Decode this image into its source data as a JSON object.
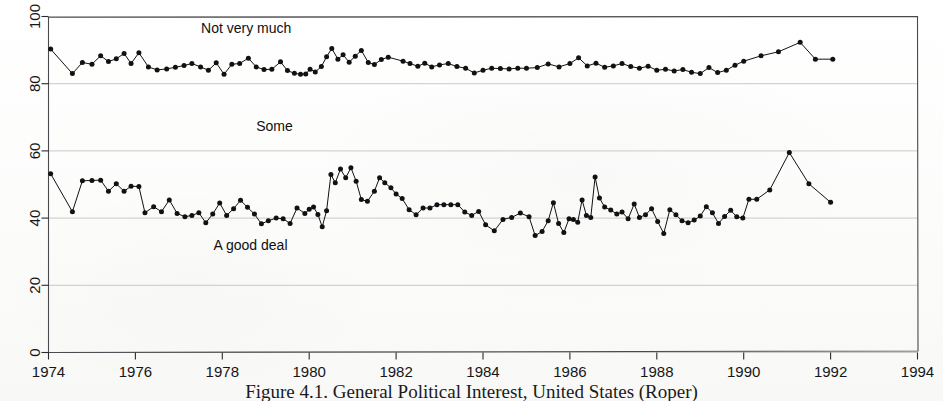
{
  "figure": {
    "caption": "Figure 4.1.  General Political Interest, United States (Roper)",
    "background_color": "#fdfdfc",
    "ink_color": "#111114",
    "gridline_color": "#c9c9c9"
  },
  "chart_data": {
    "type": "line",
    "title": "",
    "subtitle": "",
    "xlabel": "",
    "ylabel": "",
    "xlim": [
      1974,
      1994
    ],
    "ylim": [
      0,
      100
    ],
    "xticks": [
      1974,
      1976,
      1978,
      1980,
      1982,
      1984,
      1986,
      1988,
      1990,
      1992,
      1994
    ],
    "yticks": [
      0,
      20,
      40,
      60,
      80,
      100
    ],
    "xtick_labels": [
      "1974",
      "1976",
      "1978",
      "1980",
      "1982",
      "1984",
      "1986",
      "1988",
      "1990",
      "1992",
      "1994"
    ],
    "ytick_labels": [
      "0",
      "20",
      "40",
      "60",
      "80",
      "100"
    ],
    "grid": true,
    "grid_axis": "y",
    "legend": "none",
    "marker": "filled-circle",
    "annotations": [
      {
        "id": "not-very-much",
        "text": "Not very much",
        "x": 1978.55,
        "y": 95.0
      },
      {
        "id": "some",
        "text": "Some",
        "x": 1979.2,
        "y": 66.0
      },
      {
        "id": "a-good-deal",
        "text": "A good deal",
        "x": 1978.65,
        "y": 30.5
      }
    ],
    "series": [
      {
        "name": "Not very much",
        "color": "#111114",
        "points": [
          [
            1974.05,
            90.3
          ],
          [
            1974.55,
            83.0
          ],
          [
            1974.78,
            86.3
          ],
          [
            1975.0,
            85.8
          ],
          [
            1975.2,
            88.3
          ],
          [
            1975.38,
            86.6
          ],
          [
            1975.56,
            87.4
          ],
          [
            1975.74,
            89.0
          ],
          [
            1975.9,
            86.0
          ],
          [
            1976.08,
            89.2
          ],
          [
            1976.3,
            85.0
          ],
          [
            1976.5,
            84.1
          ],
          [
            1976.72,
            84.4
          ],
          [
            1976.92,
            84.9
          ],
          [
            1977.12,
            85.4
          ],
          [
            1977.3,
            86.0
          ],
          [
            1977.5,
            85.0
          ],
          [
            1977.68,
            84.0
          ],
          [
            1977.86,
            86.2
          ],
          [
            1978.04,
            82.8
          ],
          [
            1978.22,
            85.8
          ],
          [
            1978.4,
            86.0
          ],
          [
            1978.6,
            87.6
          ],
          [
            1978.78,
            85.0
          ],
          [
            1978.96,
            84.2
          ],
          [
            1979.14,
            84.3
          ],
          [
            1979.34,
            86.5
          ],
          [
            1979.5,
            83.9
          ],
          [
            1979.66,
            83.1
          ],
          [
            1979.8,
            82.8
          ],
          [
            1979.92,
            82.9
          ],
          [
            1980.02,
            84.3
          ],
          [
            1980.14,
            83.5
          ],
          [
            1980.28,
            85.1
          ],
          [
            1980.4,
            88.0
          ],
          [
            1980.52,
            90.5
          ],
          [
            1980.66,
            87.3
          ],
          [
            1980.78,
            88.6
          ],
          [
            1980.92,
            86.4
          ],
          [
            1981.06,
            88.2
          ],
          [
            1981.2,
            89.9
          ],
          [
            1981.36,
            86.3
          ],
          [
            1981.5,
            85.7
          ],
          [
            1981.66,
            87.2
          ],
          [
            1981.82,
            87.9
          ],
          [
            1182.0,
            86.8
          ],
          [
            1982.16,
            86.7
          ],
          [
            1982.32,
            86.0
          ],
          [
            1982.5,
            85.2
          ],
          [
            1982.66,
            86.1
          ],
          [
            1982.82,
            85.0
          ],
          [
            1983.0,
            85.6
          ],
          [
            1983.2,
            86.0
          ],
          [
            1983.4,
            85.1
          ],
          [
            1983.6,
            84.6
          ],
          [
            1983.8,
            83.2
          ],
          [
            1984.0,
            84.0
          ],
          [
            1984.2,
            84.6
          ],
          [
            1984.4,
            84.5
          ],
          [
            1984.6,
            84.4
          ],
          [
            1984.8,
            84.6
          ],
          [
            1985.0,
            84.6
          ],
          [
            1985.25,
            84.8
          ],
          [
            1985.5,
            85.9
          ],
          [
            1985.75,
            85.0
          ],
          [
            1986.0,
            86.0
          ],
          [
            1986.2,
            87.7
          ],
          [
            1986.4,
            85.3
          ],
          [
            1986.6,
            86.1
          ],
          [
            1986.8,
            84.9
          ],
          [
            1987.0,
            85.3
          ],
          [
            1987.2,
            86.0
          ],
          [
            1987.4,
            85.1
          ],
          [
            1987.6,
            84.6
          ],
          [
            1987.8,
            85.2
          ],
          [
            1988.0,
            84.0
          ],
          [
            1988.2,
            84.3
          ],
          [
            1988.4,
            83.8
          ],
          [
            1988.6,
            84.2
          ],
          [
            1988.8,
            83.4
          ],
          [
            1989.0,
            83.0
          ],
          [
            1989.2,
            84.8
          ],
          [
            1989.4,
            83.3
          ],
          [
            1989.6,
            84.0
          ],
          [
            1989.8,
            85.5
          ],
          [
            1990.0,
            86.7
          ],
          [
            1990.4,
            88.3
          ],
          [
            1990.8,
            89.5
          ],
          [
            1991.3,
            92.3
          ],
          [
            1991.65,
            87.3
          ],
          [
            1992.05,
            87.3
          ]
        ]
      },
      {
        "name": "A good deal",
        "color": "#111114",
        "points": [
          [
            1974.05,
            53.2
          ],
          [
            1974.55,
            41.9
          ],
          [
            1974.78,
            51.1
          ],
          [
            1975.0,
            51.2
          ],
          [
            1975.2,
            51.3
          ],
          [
            1975.38,
            48.0
          ],
          [
            1975.56,
            50.2
          ],
          [
            1975.74,
            48.0
          ],
          [
            1975.9,
            49.5
          ],
          [
            1976.08,
            49.4
          ],
          [
            1976.22,
            41.6
          ],
          [
            1976.42,
            43.4
          ],
          [
            1976.6,
            41.9
          ],
          [
            1976.78,
            45.4
          ],
          [
            1976.96,
            41.4
          ],
          [
            1977.14,
            40.4
          ],
          [
            1977.3,
            40.8
          ],
          [
            1977.46,
            41.6
          ],
          [
            1977.62,
            38.6
          ],
          [
            1977.78,
            41.2
          ],
          [
            1977.94,
            44.5
          ],
          [
            1978.1,
            40.8
          ],
          [
            1978.26,
            42.8
          ],
          [
            1978.42,
            45.3
          ],
          [
            1978.58,
            43.2
          ],
          [
            1978.74,
            41.2
          ],
          [
            1978.9,
            38.3
          ],
          [
            1979.06,
            39.2
          ],
          [
            1979.24,
            40.0
          ],
          [
            1979.4,
            39.8
          ],
          [
            1979.56,
            38.4
          ],
          [
            1979.72,
            43.0
          ],
          [
            1979.9,
            41.4
          ],
          [
            1980.0,
            42.6
          ],
          [
            1980.1,
            43.3
          ],
          [
            1980.2,
            41.1
          ],
          [
            1980.3,
            37.4
          ],
          [
            1980.4,
            42.2
          ],
          [
            1980.5,
            53.0
          ],
          [
            1980.6,
            50.5
          ],
          [
            1980.72,
            54.6
          ],
          [
            1980.84,
            52.0
          ],
          [
            1980.96,
            55.0
          ],
          [
            1981.08,
            51.0
          ],
          [
            1981.2,
            45.5
          ],
          [
            1981.34,
            45.0
          ],
          [
            1981.5,
            48.0
          ],
          [
            1981.62,
            52.0
          ],
          [
            1981.74,
            50.5
          ],
          [
            1981.88,
            49.0
          ],
          [
            1982.0,
            47.2
          ],
          [
            1982.14,
            45.8
          ],
          [
            1982.3,
            42.5
          ],
          [
            1982.46,
            41.0
          ],
          [
            1982.62,
            43.0
          ],
          [
            1982.78,
            43.0
          ],
          [
            1982.94,
            44.0
          ],
          [
            1983.1,
            44.0
          ],
          [
            1983.26,
            44.0
          ],
          [
            1983.42,
            44.0
          ],
          [
            1983.58,
            41.8
          ],
          [
            1983.74,
            40.8
          ],
          [
            1983.9,
            42.0
          ],
          [
            1984.06,
            38.0
          ],
          [
            1984.26,
            36.2
          ],
          [
            1984.46,
            39.6
          ],
          [
            1984.66,
            40.2
          ],
          [
            1984.86,
            41.5
          ],
          [
            1985.06,
            40.4
          ],
          [
            1985.2,
            34.8
          ],
          [
            1985.36,
            36.0
          ],
          [
            1985.5,
            39.2
          ],
          [
            1985.62,
            44.6
          ],
          [
            1985.74,
            38.4
          ],
          [
            1985.86,
            35.7
          ],
          [
            1985.98,
            39.8
          ],
          [
            1986.08,
            39.6
          ],
          [
            1986.18,
            38.8
          ],
          [
            1986.28,
            45.4
          ],
          [
            1986.38,
            40.8
          ],
          [
            1986.48,
            40.2
          ],
          [
            1986.58,
            52.2
          ],
          [
            1986.68,
            46.0
          ],
          [
            1986.8,
            43.3
          ],
          [
            1986.94,
            42.4
          ],
          [
            1987.08,
            41.2
          ],
          [
            1987.2,
            41.8
          ],
          [
            1987.34,
            39.8
          ],
          [
            1987.48,
            44.2
          ],
          [
            1987.6,
            40.2
          ],
          [
            1987.74,
            41.0
          ],
          [
            1987.88,
            42.8
          ],
          [
            1988.02,
            39.0
          ],
          [
            1988.16,
            35.4
          ],
          [
            1988.3,
            42.5
          ],
          [
            1988.44,
            41.0
          ],
          [
            1988.58,
            39.2
          ],
          [
            1988.72,
            38.6
          ],
          [
            1988.86,
            39.4
          ],
          [
            1989.0,
            40.6
          ],
          [
            1989.14,
            43.4
          ],
          [
            1989.28,
            41.6
          ],
          [
            1989.42,
            38.4
          ],
          [
            1989.56,
            40.5
          ],
          [
            1989.7,
            42.3
          ],
          [
            1989.84,
            40.4
          ],
          [
            1989.98,
            40.0
          ],
          [
            1990.12,
            45.6
          ],
          [
            1990.3,
            45.6
          ],
          [
            1990.6,
            48.4
          ],
          [
            1991.05,
            59.5
          ],
          [
            1991.5,
            50.2
          ],
          [
            1992.0,
            44.7
          ]
        ]
      }
    ]
  }
}
